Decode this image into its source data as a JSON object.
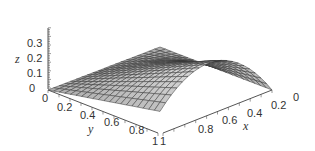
{
  "chart_data": {
    "type": "surface3d",
    "title": "",
    "xlabel": "x",
    "ylabel": "y",
    "zlabel": "z",
    "xlim": [
      0,
      1
    ],
    "ylim": [
      0,
      1
    ],
    "zlim": [
      0,
      0.35
    ],
    "x_ticks": [
      "0",
      "0.2",
      "0.4",
      "0.6",
      "0.8",
      "1"
    ],
    "y_ticks": [
      "0",
      "0.2",
      "0.4",
      "0.6",
      "0.8",
      "1"
    ],
    "z_ticks": [
      "0",
      "0.1",
      "0.2",
      "0.3"
    ],
    "grid": "mesh 20x20 on surface",
    "surface_samples": {
      "note": "approximate z values read from surface silhouette",
      "points": [
        {
          "x": 1,
          "y": 0,
          "z": 0
        },
        {
          "x": 0,
          "y": 1,
          "z": 0
        },
        {
          "x": 1,
          "y": 1,
          "z": 0.14
        },
        {
          "x": 0.55,
          "y": 1,
          "z": 0.34
        }
      ]
    },
    "colors": {
      "surface": "#c8c8c8",
      "mesh": "#333333",
      "axes": "#555555"
    }
  }
}
